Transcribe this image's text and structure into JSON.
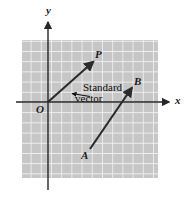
{
  "figure": {
    "type": "vector-diagram",
    "colors": {
      "grid_fill": "#c6c6c6",
      "grid_line": "#f2f2f2",
      "axis": "#262626",
      "vector": "#2b2b2b",
      "label": "#141414",
      "background": "#ffffff"
    },
    "grid": {
      "left": 22,
      "top": 40,
      "right": 158,
      "bottom": 178,
      "cell": 10.2,
      "columns": 13,
      "rows": 13
    },
    "axes": {
      "x_label": "x",
      "y_label": "y",
      "origin_label": "O",
      "x_axis_y": 102,
      "y_axis_x": 48,
      "x_axis_start": 16,
      "x_axis_end": 170,
      "y_axis_start": 20,
      "y_axis_end": 190
    },
    "vectors": [
      {
        "name": "OP",
        "tail_label": "O",
        "head_label": "P",
        "tail": [
          48,
          102
        ],
        "head": [
          94,
          61
        ],
        "note": "standard position vector"
      },
      {
        "name": "AB",
        "tail_label": "A",
        "head_label": "B",
        "tail": [
          90,
          149
        ],
        "head": [
          133,
          87
        ],
        "note": "equivalent vector"
      }
    ],
    "labels": {
      "point_p": "P",
      "point_b": "B",
      "point_a": "A",
      "origin": "O",
      "axis_x": "x",
      "axis_y": "y"
    },
    "annotation": {
      "line1": "Standard",
      "line2": "vector",
      "leader_from": [
        90,
        96
      ],
      "leader_to": [
        71,
        93
      ]
    }
  }
}
